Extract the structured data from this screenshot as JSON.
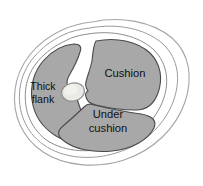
{
  "diagram": {
    "type": "anatomical-cross-section",
    "colors": {
      "muscle_fill": "#a8a8a8",
      "muscle_stroke": "#4a4a4a",
      "connective_fill": "#ffffff",
      "connective_stroke": "#8a8a8a",
      "outer_stroke": "#9a9a9a",
      "bone_fill": "#e8e8e4",
      "bone_stroke": "#8f8f8f",
      "label_color": "#101010",
      "background": "#ffffff"
    },
    "regions": [
      {
        "id": "thick-flank",
        "label_lines": [
          "Thick",
          "flank"
        ],
        "label_x": 43,
        "label_y": 93
      },
      {
        "id": "cushion",
        "label_lines": [
          "Cushion"
        ],
        "label_x": 125,
        "label_y": 74
      },
      {
        "id": "under-cushion",
        "label_lines": [
          "Under",
          "cushion"
        ],
        "label_x": 108,
        "label_y": 120
      }
    ],
    "bone": {
      "id": "central-bone",
      "label": ""
    }
  }
}
